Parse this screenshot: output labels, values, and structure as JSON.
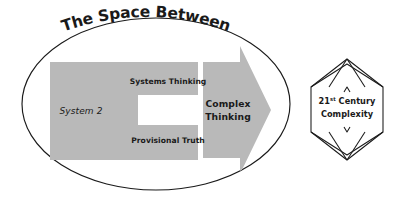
{
  "diagram": {
    "title": "The Space Between",
    "colors": {
      "gray_fill": "#b9b9b9",
      "stroke": "#1a1a1a",
      "text": "#1a1a1a",
      "background": "#ffffff"
    },
    "container": {
      "shape_name": "ellipse"
    },
    "c_block": {
      "labels": {
        "top": "Systems Thinking",
        "left": "System 2",
        "bottom": "Provisional Truth"
      }
    },
    "arrow": {
      "label_line1": "Complex",
      "label_line2": "Thinking",
      "direction": "right"
    },
    "polyhedron": {
      "label_line1_main": "Century",
      "label_line1_number": "21",
      "label_line1_ordinal": "st",
      "label_line2": "Complexity"
    }
  }
}
